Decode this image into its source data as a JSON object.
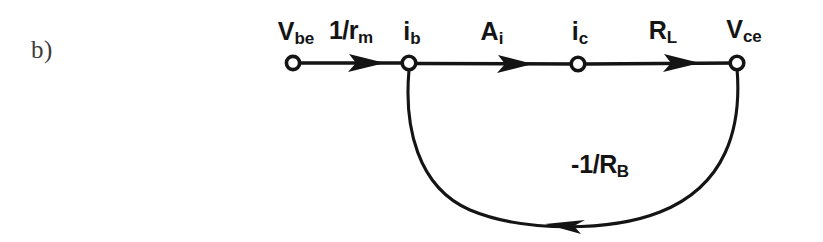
{
  "figure": {
    "part_label": "b)",
    "type": "signal flow graph",
    "background_color": "#ffffff",
    "ink_color": "#141414"
  },
  "nodes": [
    {
      "id": "vbe",
      "base": "V",
      "sub": "be",
      "x": 293,
      "y": 63,
      "label_x": 296,
      "label_y": 17
    },
    {
      "id": "ib",
      "base": "i",
      "sub": "b",
      "x": 409,
      "y": 63,
      "label_x": 412,
      "label_y": 17
    },
    {
      "id": "ic",
      "base": "i",
      "sub": "c",
      "x": 578,
      "y": 63,
      "label_x": 580,
      "label_y": 17
    },
    {
      "id": "vce",
      "base": "V",
      "sub": "ce",
      "x": 737,
      "y": 63,
      "label_x": 744,
      "label_y": 15
    }
  ],
  "branches": [
    {
      "id": "gm",
      "from": "vbe",
      "to": "ib",
      "base": "1/r",
      "sub": "m",
      "label_x": 351,
      "label_y": 16,
      "arrow_tip_x": 385
    },
    {
      "id": "ai",
      "from": "ib",
      "to": "ic",
      "base": "A",
      "sub": "i",
      "label_x": 492,
      "label_y": 17,
      "arrow_tip_x": 533
    },
    {
      "id": "rl",
      "from": "ic",
      "to": "vce",
      "base": "R",
      "sub": "L",
      "label_x": 663,
      "label_y": 16,
      "arrow_tip_x": 700
    }
  ],
  "feedback": {
    "id": "rb",
    "from": "vce",
    "to": "ib",
    "sign": "-",
    "base": "1/R",
    "sub": "B",
    "label_x": 600,
    "label_y": 150,
    "arrow_tip_x": 545,
    "arrow_tip_y": 224
  }
}
